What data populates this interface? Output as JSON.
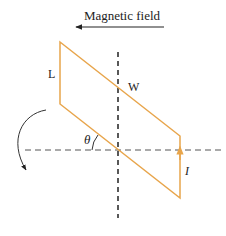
{
  "title": "Magnetic field",
  "labels": {
    "length": "L",
    "width": "W",
    "angle": "θ",
    "current": "I"
  },
  "colors": {
    "loop": "#e8a54b",
    "axes": "#444444",
    "text": "#222222",
    "background": "#ffffff"
  }
}
